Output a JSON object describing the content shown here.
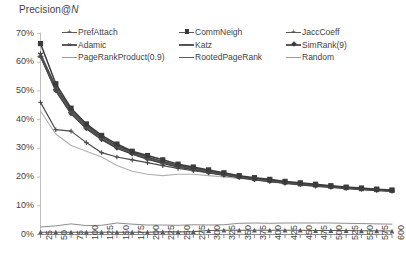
{
  "chart": {
    "title_prefix": "Precision@",
    "title_italic": "N",
    "title_full": "Precision@N"
  },
  "axis": {
    "y_ticks": [
      "0%",
      "10%",
      "20%",
      "30%",
      "40%",
      "50%",
      "60%",
      "70%"
    ],
    "x_ticks": [
      "25",
      "50",
      "75",
      "100",
      "125",
      "150",
      "175",
      "200",
      "225",
      "250",
      "275",
      "300",
      "325",
      "350",
      "375",
      "400",
      "425",
      "450",
      "475",
      "500",
      "525",
      "550",
      "575",
      "600"
    ]
  },
  "legend": {
    "items": [
      {
        "label": "PrefAttach",
        "marker": "plus",
        "style": "bold"
      },
      {
        "label": "CommNeigh",
        "marker": "sq",
        "style": "bold"
      },
      {
        "label": "JaccCoeff",
        "marker": "plus",
        "style": "bold"
      },
      {
        "label": "Adamic",
        "marker": "cross",
        "style": "bold"
      },
      {
        "label": "Katz",
        "marker": "dash",
        "style": "bold"
      },
      {
        "label": "SimRank(9)",
        "marker": "dia",
        "style": "bold"
      },
      {
        "label": "PageRankProduct(0.9)",
        "marker": "none",
        "style": "thin"
      },
      {
        "label": "RootedPageRank",
        "marker": "none",
        "style": "bold"
      },
      {
        "label": "Random",
        "marker": "none",
        "style": "thin"
      }
    ]
  },
  "chart_data": {
    "type": "line",
    "title": "Precision@N",
    "xlabel": "",
    "ylabel": "",
    "ylim": [
      0,
      70
    ],
    "yunit": "%",
    "xlim": [
      25,
      600
    ],
    "grid": false,
    "legend_position": "top",
    "x": [
      25,
      50,
      75,
      100,
      125,
      150,
      175,
      200,
      225,
      250,
      275,
      300,
      325,
      350,
      375,
      400,
      425,
      450,
      475,
      500,
      525,
      550,
      575,
      600
    ],
    "series": [
      {
        "name": "CommNeigh",
        "marker": "square",
        "values": [
          66.5,
          52.5,
          44.0,
          38.5,
          34.5,
          31.5,
          29.0,
          27.5,
          26.0,
          24.5,
          23.5,
          22.5,
          21.5,
          20.5,
          19.8,
          19.2,
          18.5,
          18.0,
          17.5,
          17.0,
          16.5,
          16.2,
          15.8,
          15.5
        ]
      },
      {
        "name": "JaccCoeff",
        "marker": "plus",
        "values": [
          63.0,
          51.5,
          43.5,
          38.0,
          34.0,
          31.0,
          28.8,
          27.0,
          25.5,
          24.2,
          23.2,
          22.2,
          21.2,
          20.3,
          19.6,
          19.0,
          18.3,
          17.8,
          17.3,
          16.8,
          16.4,
          16.0,
          15.7,
          15.4
        ]
      },
      {
        "name": "Adamic",
        "marker": "cross",
        "values": [
          62.5,
          51.0,
          43.0,
          37.5,
          33.8,
          30.8,
          28.5,
          26.8,
          25.3,
          24.0,
          23.0,
          22.0,
          21.0,
          20.2,
          19.5,
          18.8,
          18.2,
          17.6,
          17.2,
          16.7,
          16.3,
          15.9,
          15.6,
          15.3
        ]
      },
      {
        "name": "Katz",
        "marker": "dash",
        "values": [
          62.0,
          50.5,
          42.5,
          37.2,
          33.5,
          30.5,
          28.2,
          26.5,
          25.0,
          23.8,
          22.8,
          21.8,
          20.8,
          20.0,
          19.3,
          18.6,
          18.0,
          17.5,
          17.0,
          16.6,
          16.2,
          15.8,
          15.5,
          15.2
        ]
      },
      {
        "name": "SimRank(9)",
        "marker": "diamond",
        "values": [
          62.0,
          50.0,
          42.0,
          36.8,
          33.0,
          30.0,
          28.0,
          26.2,
          24.8,
          23.5,
          22.5,
          21.5,
          20.6,
          19.8,
          19.0,
          18.4,
          17.8,
          17.3,
          16.8,
          16.4,
          16.0,
          15.6,
          15.3,
          15.0
        ]
      },
      {
        "name": "RootedPageRank",
        "marker": "none",
        "values": [
          62.0,
          50.2,
          42.2,
          37.0,
          33.2,
          30.2,
          28.1,
          26.4,
          24.9,
          23.6,
          22.6,
          21.6,
          20.7,
          19.9,
          19.2,
          18.5,
          17.9,
          17.4,
          16.9,
          16.5,
          16.1,
          15.7,
          15.4,
          15.1
        ]
      },
      {
        "name": "PrefAttach",
        "marker": "plus",
        "values": [
          46.0,
          36.5,
          36.0,
          32.0,
          28.5,
          27.0,
          26.0,
          25.0,
          24.0,
          23.0,
          22.2,
          21.5,
          20.8,
          20.0,
          19.4,
          18.8,
          18.2,
          17.7,
          17.2,
          16.8,
          16.4,
          16.0,
          15.7,
          15.4
        ]
      },
      {
        "name": "PageRankProduct(0.9)",
        "marker": "none",
        "values": [
          43.0,
          35.0,
          31.0,
          29.0,
          27.0,
          24.0,
          22.0,
          21.0,
          20.5,
          21.0,
          21.0,
          20.5,
          20.0,
          19.5,
          19.0,
          18.5,
          18.0,
          17.5,
          17.2,
          16.8,
          16.4,
          16.0,
          15.7,
          15.4
        ]
      },
      {
        "name": "Random",
        "marker": "none",
        "values": [
          2.6,
          3.0,
          3.7,
          3.1,
          3.2,
          4.0,
          3.6,
          3.3,
          3.3,
          3.2,
          3.4,
          3.3,
          3.4,
          3.9,
          4.0,
          3.9,
          4.0,
          4.0,
          4.0,
          4.0,
          3.9,
          3.8,
          3.7,
          3.6
        ]
      },
      {
        "name": "low-triangle-series",
        "marker": "triangle",
        "values": [
          0.8,
          0.8,
          0.8,
          0.8,
          0.8,
          0.8,
          0.8,
          0.8,
          0.9,
          0.9,
          1.0,
          1.4,
          1.5,
          1.5,
          1.5,
          1.5,
          1.5,
          1.5,
          1.4,
          1.4,
          1.4,
          1.3,
          1.3,
          1.2
        ]
      }
    ]
  }
}
